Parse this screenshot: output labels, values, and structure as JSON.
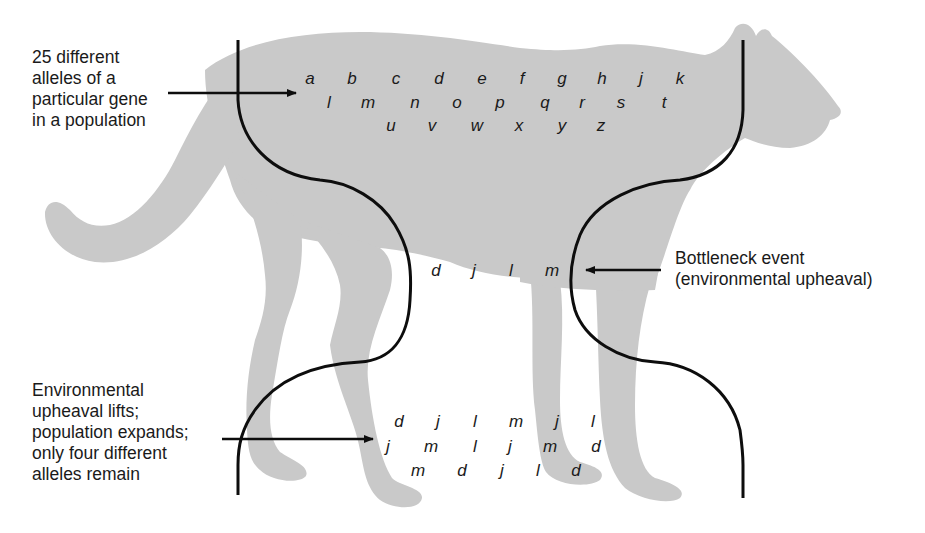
{
  "colors": {
    "silhouette": "#c9c9c9",
    "line": "#0d0d0d",
    "text": "#1a1a1a",
    "background": "#ffffff"
  },
  "annotations": {
    "original_population": "25 different\nalleles of a\nparticular gene\nin a population",
    "bottleneck": "Bottleneck event\n(environmental upheaval)",
    "recovery": "Environmental\nupheaval lifts;\npopulation expands;\nonly four different\nalleles remain"
  },
  "original_alleles": {
    "row1": [
      "a",
      "b",
      "c",
      "d",
      "e",
      "f",
      "g",
      "h",
      "j",
      "k"
    ],
    "row2": [
      "l",
      "m",
      "n",
      "o",
      "p",
      "q",
      "r",
      "s",
      "t"
    ],
    "row3": [
      "u",
      "v",
      "w",
      "x",
      "y",
      "z"
    ]
  },
  "bottleneck_alleles": [
    "d",
    "j",
    "l",
    "m"
  ],
  "expanded_alleles": {
    "row1": [
      "d",
      "j",
      "l",
      "m",
      "j",
      "l"
    ],
    "row2": [
      "j",
      "m",
      "l",
      "j",
      "m",
      "d"
    ],
    "row3": [
      "m",
      "d",
      "j",
      "l",
      "d"
    ]
  }
}
